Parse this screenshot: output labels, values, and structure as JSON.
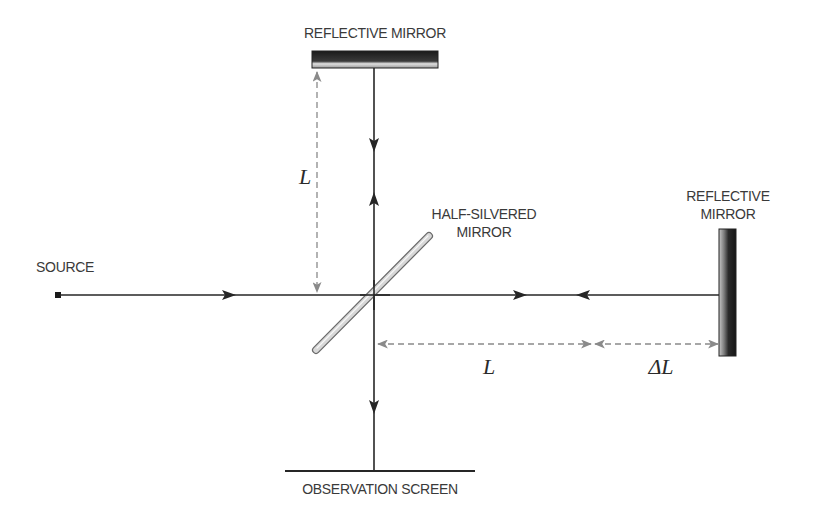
{
  "diagram": {
    "type": "Michelson interferometer",
    "labels": {
      "top_mirror": "REFLECTIVE MIRROR",
      "right_mirror_line1": "REFLECTIVE",
      "right_mirror_line2": "MIRROR",
      "half_silvered_line1": "HALF-SILVERED",
      "half_silvered_line2": "MIRROR",
      "source": "SOURCE",
      "screen": "OBSERVATION SCREEN",
      "vertical_length": "L",
      "horizontal_length": "L",
      "delta_length": "ΔL"
    },
    "colors": {
      "beam": "#262626",
      "dimension": "#8a8a8a",
      "mirror_dark": "#1e1e1e",
      "mirror_light": "#d8d8d8",
      "text": "#3a3a3a"
    }
  }
}
